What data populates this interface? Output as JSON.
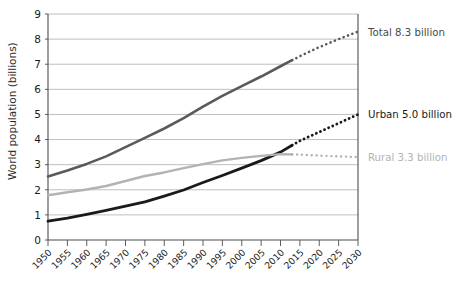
{
  "chart_data": {
    "type": "line",
    "title": "",
    "xlabel": "",
    "ylabel": "World population (billions)",
    "xlim": [
      1950,
      2030
    ],
    "ylim": [
      0,
      9
    ],
    "grid": true,
    "legend_position": "right-inline",
    "x": [
      1950,
      1955,
      1960,
      1965,
      1970,
      1975,
      1980,
      1985,
      1990,
      1995,
      2000,
      2005,
      2010,
      2015,
      2020,
      2025,
      2030
    ],
    "xtick_labels": [
      "1950",
      "1955",
      "1960",
      "1965",
      "1970",
      "1975",
      "1980",
      "1985",
      "1990",
      "1995",
      "2000",
      "2005",
      "2010",
      "2015",
      "2020",
      "2025",
      "2030"
    ],
    "ytick_labels": [
      "0",
      "1",
      "2",
      "3",
      "4",
      "5",
      "6",
      "7",
      "8",
      "9"
    ],
    "ytick_values": [
      0,
      1,
      2,
      3,
      4,
      5,
      6,
      7,
      8,
      9
    ],
    "series": [
      {
        "name": "Total",
        "label": "Total 8.3 billion",
        "color": "#5a5a5a",
        "end_value": 8.3,
        "solid_through": 2013,
        "values": [
          2.53,
          2.77,
          3.03,
          3.33,
          3.7,
          4.07,
          4.44,
          4.85,
          5.31,
          5.74,
          6.13,
          6.51,
          6.92,
          7.32,
          7.68,
          8.0,
          8.3
        ],
        "forecast_dashed_from": 2013
      },
      {
        "name": "Urban",
        "label": "Urban 5.0 billion",
        "color": "#1a1a1a",
        "end_value": 5.0,
        "solid_through": 2013,
        "values": [
          0.75,
          0.87,
          1.02,
          1.18,
          1.35,
          1.52,
          1.75,
          1.99,
          2.29,
          2.57,
          2.86,
          3.16,
          3.5,
          3.95,
          4.3,
          4.65,
          5.0
        ],
        "forecast_dashed_from": 2013
      },
      {
        "name": "Rural",
        "label": "Rural 3.3 billion",
        "color": "#b3b3b3",
        "end_value": 3.3,
        "solid_through": 2013,
        "values": [
          1.78,
          1.9,
          2.01,
          2.15,
          2.35,
          2.55,
          2.69,
          2.86,
          3.02,
          3.17,
          3.27,
          3.35,
          3.42,
          3.4,
          3.36,
          3.33,
          3.3
        ],
        "forecast_dashed_from": 2013
      }
    ]
  },
  "labels": {
    "total": "Total 8.3 billion",
    "urban": "Urban 5.0 billion",
    "rural": "Rural 3.3 billion",
    "y_axis_title": "World population (billions)"
  },
  "colors": {
    "total": "#5a5a5a",
    "urban": "#1a1a1a",
    "rural": "#b3b3b3",
    "grid": "#b8b8b8",
    "axis": "#4d4d4d",
    "background": "#ffffff"
  }
}
